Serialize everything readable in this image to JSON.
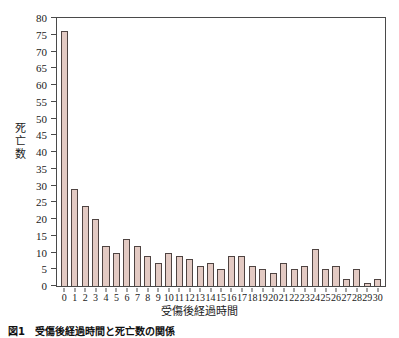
{
  "figure": {
    "caption": "図1　受傷後経過時間と死亡数の関係"
  },
  "chart_data": {
    "type": "bar",
    "title": "",
    "subtitle": "",
    "xlabel": "受傷後経過時間",
    "ylabel": "死亡数",
    "categories": [
      "0",
      "1",
      "2",
      "3",
      "4",
      "5",
      "6",
      "7",
      "8",
      "9",
      "10",
      "11",
      "12",
      "13",
      "14",
      "15",
      "16",
      "17",
      "18",
      "19",
      "20",
      "21",
      "22",
      "23",
      "24",
      "25",
      "26",
      "27",
      "28",
      "29",
      "30"
    ],
    "values": [
      76,
      29,
      24,
      20,
      12,
      10,
      14,
      12,
      9,
      7,
      10,
      9,
      8,
      6,
      7,
      5,
      9,
      9,
      6,
      5,
      4,
      7,
      5,
      6,
      11,
      5,
      6,
      2,
      5,
      1,
      2
    ],
    "ylim": [
      0,
      80
    ],
    "ytick_step": 5,
    "yticks": [
      0,
      5,
      10,
      15,
      20,
      25,
      30,
      35,
      40,
      45,
      50,
      55,
      60,
      65,
      70,
      75,
      80
    ],
    "xlim": [
      0,
      30
    ],
    "grid": false,
    "legend": null,
    "legend_position": "none",
    "bar_color": "#e3cac3",
    "bar_border_color": "#4f4442",
    "axis_color": "#4a4a4a",
    "background_color": "#ffffff"
  }
}
